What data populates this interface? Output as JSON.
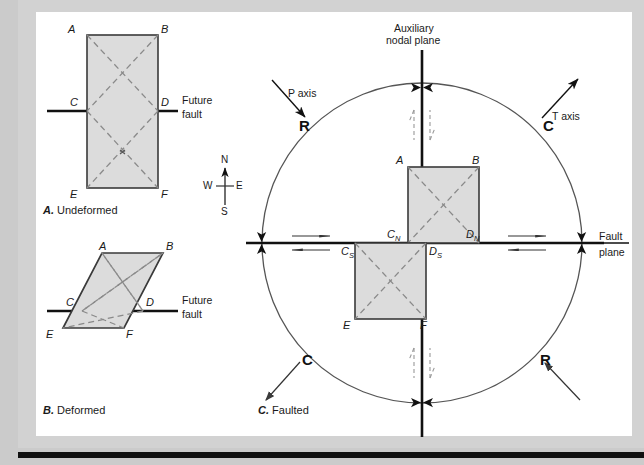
{
  "figure": {
    "panels": [
      {
        "id": "A",
        "key": "A.",
        "caption": "Undeformed",
        "fault_label_line1": "Future",
        "fault_label_line2": "fault",
        "corner_labels": [
          "A",
          "B",
          "C",
          "D",
          "E",
          "F"
        ]
      },
      {
        "id": "B",
        "key": "B.",
        "caption": "Deformed",
        "fault_label_line1": "Future",
        "fault_label_line2": "fault",
        "corner_labels": [
          "A",
          "B",
          "C",
          "D",
          "E",
          "F"
        ]
      },
      {
        "id": "C",
        "key": "C.",
        "caption": "Faulted",
        "corner_labels": [
          "A",
          "B",
          "E",
          "F"
        ],
        "block_labels": [
          {
            "base": "C",
            "sub": "N"
          },
          {
            "base": "D",
            "sub": "N"
          },
          {
            "base": "C",
            "sub": "S"
          },
          {
            "base": "D",
            "sub": "S"
          }
        ]
      }
    ],
    "compass": {
      "north": "N",
      "south": "S",
      "east": "E",
      "west": "W"
    },
    "focal_mechanism": {
      "auxiliary_plane_label_line1": "Auxiliary",
      "auxiliary_plane_label_line2": "nodal plane",
      "fault_plane_label_line1": "Fault",
      "fault_plane_label_line2": "plane",
      "p_axis_label": "P axis",
      "t_axis_label": "T axis",
      "quadrant_markers": [
        {
          "letter": "R",
          "position": "upper-left"
        },
        {
          "letter": "C",
          "position": "upper-right"
        },
        {
          "letter": "C",
          "position": "lower-left"
        },
        {
          "letter": "R",
          "position": "lower-right"
        }
      ]
    },
    "colors": {
      "block_fill": "#dcdcdc",
      "block_stroke": "#3a3a3a",
      "dashed_stroke": "#8a8a8a",
      "fault_line": "#111111",
      "circle_stroke": "#555555",
      "page_background": "#cbcbcb",
      "panel_background": "#ffffff"
    }
  }
}
